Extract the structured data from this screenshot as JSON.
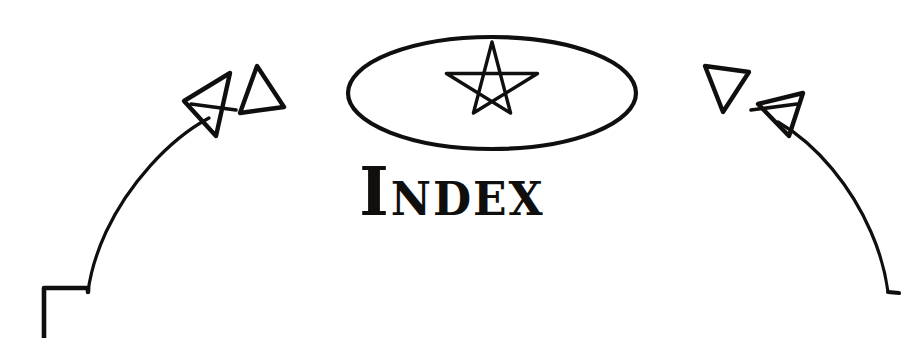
{
  "page": {
    "title": "Index",
    "width": 904,
    "height": 338,
    "background_color": "#ffffff",
    "ink_color": "#100f0e",
    "style": "hand-drawn black ink decorative chapter header"
  },
  "heading": {
    "text": "Index",
    "display_style": "small-caps uncial",
    "color": "#100f0e"
  },
  "emblem": {
    "name": "pentagram-in-ellipse",
    "ellipse": {
      "center_x": 492,
      "center_y": 93,
      "radius_x": 144,
      "radius_y": 56,
      "stroke_width": 4
    },
    "pentagram": {
      "center_x": 492,
      "center_y": 90,
      "radius": 48,
      "points": 5,
      "stroke_width": 3.4,
      "filled": false
    }
  },
  "ornaments": {
    "left_arc": {
      "name": "left-sweeping-arc",
      "stroke_width": 3.2,
      "terminal": "stepped-corner-bracket"
    },
    "right_arc": {
      "name": "right-sweeping-arc",
      "stroke_width": 3.2,
      "terminal": "hook-foot"
    },
    "markers": [
      {
        "name": "left-arrowhead",
        "shape": "triangle-with-crossbar",
        "direction": "left"
      },
      {
        "name": "left-triangle",
        "shape": "triangle-outline",
        "direction": "up"
      },
      {
        "name": "right-triangle",
        "shape": "triangle-outline",
        "direction": "down"
      },
      {
        "name": "right-arrowhead",
        "shape": "triangle-with-crossbar",
        "direction": "right"
      }
    ]
  }
}
